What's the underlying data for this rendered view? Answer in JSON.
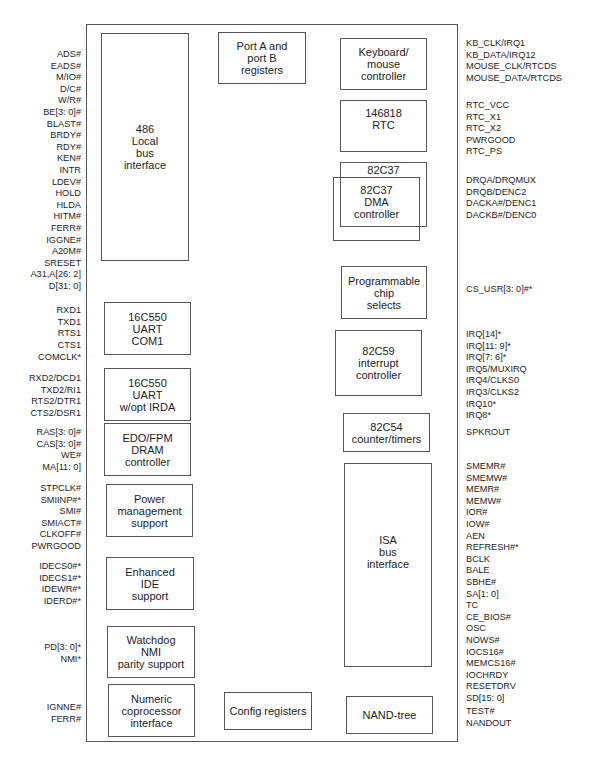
{
  "blocks": {
    "local_bus": "486\nLocal\nbus\ninterface",
    "port_ab": "Port A and\nport B\nregisters",
    "keyboard": "Keyboard/\nmouse\ncontroller",
    "rtc": "146818\nRTC",
    "dma_outer": "82C37",
    "dma_inner": "82C37\nDMA\ncontroller",
    "chip_selects": "Programmable\nchip\nselects",
    "pic": "82C59\ninterrupt\ncontroller",
    "pit": "82C54\ncounter/timers",
    "isa": "ISA\nbus\ninterface",
    "uart1": "16C550\nUART\nCOM1",
    "uart2": "16C550\nUART\nw/opt IRDA",
    "dram": "EDO/FPM\nDRAM\ncontroller",
    "power": "Power\nmanagement\nsupport",
    "ide": "Enhanced\nIDE\nsupport",
    "watchdog": "Watchdog\nNMI\nparity support",
    "numeric": "Numeric\ncoprocessor\ninterface",
    "config": "Config registers",
    "nand": "NAND-tree"
  },
  "left_pins": {
    "local_bus": [
      "ADS#",
      "EADS#",
      "M/IO#",
      "D/C#",
      "W/R#",
      "BE[3: 0]#",
      "BLAST#",
      "BRDY#",
      "RDY#",
      "KEN#",
      "INTR",
      "LDEV#",
      "HOLD",
      "HLDA",
      "HITM#",
      "FERR#",
      "IGGNE#",
      "A20M#",
      "SRESET",
      "A31,A[26: 2]",
      "D[31: 0]"
    ],
    "uart1": [
      "RXD1",
      "TXD1",
      "RTS1",
      "CTS1"
    ],
    "comclk": [
      "COMCLK*"
    ],
    "uart2": [
      "RXD2/DCD1",
      "TXD2/RI1",
      "RTS2/DTR1",
      "CTS2/DSR1"
    ],
    "dram": [
      "RAS[3: 0]#",
      "CAS[3: 0]#",
      "WE#",
      "MA[11: 0]"
    ],
    "power": [
      "STPCLK#",
      "SMIINP#*",
      "SMI#",
      "SMIACT#",
      "CLKOFF#",
      "PWRGOOD"
    ],
    "ide": [
      "IDECS0#*",
      "IDECS1#*",
      "IDEWR#*",
      "IDERD#*"
    ],
    "watchdog": [
      "PD[3: 0]*",
      "NMI*"
    ],
    "numeric": [
      "IGNNE#",
      "FERR#"
    ]
  },
  "right_pins": {
    "keyboard": [
      "KB_CLK/IRQ1",
      "KB_DATA/IRQ12",
      "MOUSE_CLK/RTCDS",
      "MOUSE_DATA/RTCDS"
    ],
    "rtc": [
      "RTC_VCC",
      "RTC_X1",
      "RTC_X2",
      "PWRGOOD",
      "RTC_PS"
    ],
    "dma": [
      "DRQA/DRQMUX",
      "DRQB/DENC2",
      "DACKA#/DENC1",
      "DACKB#/DENC0"
    ],
    "chip_selects": [
      "CS_USR[3: 0]#*"
    ],
    "pic": [
      "IRQ[14]*",
      "IRQ[11: 9]*",
      "IRQ[7: 6]*",
      "IRQ5/MUXIRQ",
      "IRQ4/CLKS0",
      "IRQ3/CLKS2",
      "IRQ10*",
      "IRQ8*"
    ],
    "pit": [
      "SPKROUT"
    ],
    "isa": [
      "SMEMR#",
      "SMEMW#",
      "MEMR#",
      "MEMW#",
      "IOR#",
      "IOW#",
      "AEN",
      "REFRESH#*",
      "BCLK",
      "BALE",
      "SBHE#",
      "SA[1: 0]",
      "TC",
      "CE_BIOS#",
      "OSC",
      "NOWS#",
      "IOCS16#",
      "MEMCS16#",
      "IOCHRDY",
      "RESETDRV",
      "SD[15: 0]"
    ],
    "nand": [
      "TEST#",
      "NANDOUT"
    ]
  }
}
